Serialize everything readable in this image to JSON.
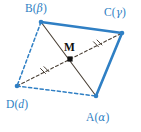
{
  "figure": {
    "type": "geometry-diagram",
    "background_color": "#ffffff",
    "colors": {
      "edge_blue": "#2f7fc4",
      "diagonal_dark": "#4a4036",
      "label_blue": "#2f7fc4",
      "label_dark": "#111111",
      "vertex_dot": "#2f7fc4",
      "midpoint_dot": "#111111"
    },
    "vertices": [
      {
        "id": "B",
        "name": "vertex-b",
        "label_base": "B",
        "label_paren_open": "(",
        "label_greek": "β",
        "label_paren_close": ")",
        "x": 41,
        "y": 22,
        "label_x": 25,
        "label_y": 3
      },
      {
        "id": "C",
        "name": "vertex-c",
        "label_base": "C",
        "label_paren_open": "(",
        "label_greek": "γ",
        "label_paren_close": ")",
        "x": 122,
        "y": 33,
        "label_x": 104,
        "label_y": 7
      },
      {
        "id": "A",
        "name": "vertex-a",
        "label_base": "A",
        "label_paren_open": "(",
        "label_greek": "α",
        "label_paren_close": ")",
        "x": 96,
        "y": 96,
        "label_x": 86,
        "label_y": 112
      },
      {
        "id": "D",
        "name": "vertex-d",
        "label_base": "D",
        "label_paren_open": "(",
        "label_greek": "d",
        "label_paren_close": ")",
        "x": 17,
        "y": 86,
        "label_x": 6,
        "label_y": 99
      }
    ],
    "midpoint": {
      "id": "M",
      "name": "midpoint-m",
      "label": "M",
      "x": 70,
      "y": 59,
      "label_x": 64,
      "label_y": 42
    },
    "edges": [
      {
        "id": "BC",
        "from": "B",
        "to": "C",
        "style": "solid",
        "color": "#2f7fc4",
        "width": 2.6
      },
      {
        "id": "CA",
        "from": "C",
        "to": "A",
        "style": "solid",
        "color": "#2f7fc4",
        "width": 2.6
      },
      {
        "id": "BD",
        "from": "B",
        "to": "D",
        "style": "dashed",
        "color": "#2f7fc4",
        "width": 1.5
      },
      {
        "id": "DA",
        "from": "D",
        "to": "A",
        "style": "dashed",
        "color": "#2f7fc4",
        "width": 1.5
      }
    ],
    "diagonals": [
      {
        "id": "BA",
        "from": "B",
        "to": "A",
        "style": "solid",
        "color": "#4a4036",
        "width": 1.1,
        "ticks": 0
      },
      {
        "id": "DC",
        "from": "D",
        "to": "C",
        "style": "dashed",
        "color": "#4a4036",
        "width": 1.1,
        "ticks": 2,
        "tick_note": "double tick marks on each half, indicating equal segments DM = MC"
      }
    ]
  }
}
